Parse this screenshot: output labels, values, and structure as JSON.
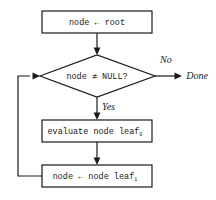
{
  "diagram": {
    "colors": {
      "stroke": "#1a1a1a",
      "fill": "#ffffff",
      "background": "#ffffff"
    },
    "nodes": {
      "init": {
        "shape": "process",
        "text": "node ← root"
      },
      "decision": {
        "shape": "decision",
        "text": "node ≠ NULL?"
      },
      "evaluate": {
        "shape": "process",
        "text": "evaluate node leaf",
        "subscript": "0"
      },
      "advance": {
        "shape": "process",
        "text": "node ← node leaf",
        "subscript": "1"
      },
      "done": {
        "shape": "terminal",
        "text": "Done"
      }
    },
    "edges": {
      "no_label": "No",
      "yes_label": "Yes"
    }
  }
}
